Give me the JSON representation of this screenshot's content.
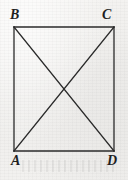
{
  "figure": {
    "kind": "geometry-diagram",
    "shape_name": "rectangle-with-diagonals",
    "background_color": "#f2f1ef",
    "stroke_color": "#2a2a2a",
    "label_color": "#1f1f1f",
    "canvas": {
      "width": 128,
      "height": 180
    }
  },
  "labels": {
    "top_left": "B",
    "top_right": "C",
    "bottom_left": "A",
    "bottom_right": "D"
  },
  "chart_data": {
    "type": "scatter",
    "title": "",
    "subtitle": "",
    "xlabel": "",
    "ylabel": "",
    "grid": false,
    "legend": "none",
    "xlim": [
      0,
      128
    ],
    "ylim": [
      0,
      180
    ],
    "vertices": [
      {
        "name": "B",
        "role": "top-left",
        "x": 14,
        "y": 27,
        "label_x": 16,
        "label_y": 18
      },
      {
        "name": "C",
        "role": "top-right",
        "x": 114,
        "y": 27,
        "label_x": 109,
        "label_y": 18
      },
      {
        "name": "D",
        "role": "bottom-right",
        "x": 114,
        "y": 151,
        "label_x": 113,
        "label_y": 164
      },
      {
        "name": "A",
        "role": "bottom-left",
        "x": 14,
        "y": 151,
        "label_x": 17,
        "label_y": 164
      }
    ],
    "edges": [
      {
        "name": "BC",
        "from": "B",
        "to": "C",
        "kind": "side",
        "x1": 14,
        "y1": 27,
        "x2": 114,
        "y2": 27
      },
      {
        "name": "CD",
        "from": "C",
        "to": "D",
        "kind": "side",
        "x1": 114,
        "y1": 27,
        "x2": 114,
        "y2": 151
      },
      {
        "name": "DA",
        "from": "D",
        "to": "A",
        "kind": "side",
        "x1": 114,
        "y1": 151,
        "x2": 14,
        "y2": 151
      },
      {
        "name": "AB",
        "from": "A",
        "to": "B",
        "kind": "side",
        "x1": 14,
        "y1": 151,
        "x2": 14,
        "y2": 27
      },
      {
        "name": "BD",
        "from": "B",
        "to": "D",
        "kind": "diagonal",
        "x1": 14,
        "y1": 27,
        "x2": 114,
        "y2": 151
      },
      {
        "name": "CA",
        "from": "C",
        "to": "A",
        "kind": "diagonal",
        "x1": 114,
        "y1": 27,
        "x2": 14,
        "y2": 151
      }
    ],
    "intersection": {
      "name": "diagonal-crossing",
      "x": 64,
      "y": 89
    },
    "measurements": {
      "width_px": 100,
      "height_px": 124,
      "stroke_width_px": 1.3
    }
  }
}
